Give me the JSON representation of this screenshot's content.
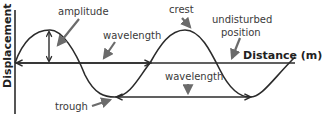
{
  "diagram": {
    "type": "transverse-wave",
    "axes": {
      "y_label": "Displacement",
      "x_label": "Distance (m)"
    },
    "labels": {
      "amplitude": "amplitude",
      "wavelength_top": "wavelength",
      "crest": "crest",
      "undisturbed_position": [
        "undisturbed",
        "position"
      ],
      "wavelength_bottom": "wavelength",
      "trough": "trough"
    },
    "colors": {
      "line": "#2b2b2b",
      "pointer_arrow": "#6b6b6b",
      "text": "#3a3a3a",
      "background": "#ffffff"
    }
  }
}
